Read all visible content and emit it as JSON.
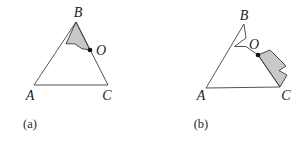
{
  "colors": {
    "background": "#ffffff",
    "line": "#3f3f3f",
    "piece_fill": "#c8c8c8",
    "piece_stroke": "#4a4a4a",
    "dot": "#111111",
    "label": "#1c1c1c"
  },
  "figures": [
    {
      "name": "triangle-a",
      "caption": "(a)",
      "outline": [
        [
          34,
          85
        ],
        [
          76,
          22
        ],
        [
          108,
          85
        ]
      ],
      "piece": [
        [
          76,
          22
        ],
        [
          90,
          50
        ],
        [
          82,
          48.7
        ],
        [
          74.7,
          43.8
        ],
        [
          66,
          43.8
        ]
      ],
      "dot": [
        90,
        50
      ],
      "labels": [
        {
          "text": "A",
          "x": 30,
          "y": 100,
          "name": "vertex-label-a"
        },
        {
          "text": "B",
          "x": 78,
          "y": 17,
          "name": "vertex-label-b"
        },
        {
          "text": "C",
          "x": 107,
          "y": 100,
          "name": "vertex-label-c"
        },
        {
          "text": "O",
          "x": 101,
          "y": 55,
          "name": "point-label-o"
        }
      ]
    },
    {
      "name": "triangle-b",
      "caption": "(b)",
      "outline": [
        [
          206,
          88
        ],
        [
          244,
          24
        ],
        [
          246,
          38
        ],
        [
          234.5,
          46.5
        ],
        [
          246,
          46.5
        ],
        [
          258,
          55
        ],
        [
          280,
          87
        ]
      ],
      "piece": [
        [
          258,
          55
        ],
        [
          270,
          50
        ],
        [
          286,
          66
        ],
        [
          279,
          70.5
        ],
        [
          287,
          75
        ],
        [
          280,
          87
        ]
      ],
      "dot": [
        258,
        55
      ],
      "labels": [
        {
          "text": "A",
          "x": 201,
          "y": 100,
          "name": "vertex-label-a"
        },
        {
          "text": "B",
          "x": 244,
          "y": 20,
          "name": "vertex-label-b"
        },
        {
          "text": "C",
          "x": 286,
          "y": 100,
          "name": "vertex-label-c"
        },
        {
          "text": "O",
          "x": 254,
          "y": 49,
          "name": "point-label-o"
        }
      ]
    }
  ]
}
